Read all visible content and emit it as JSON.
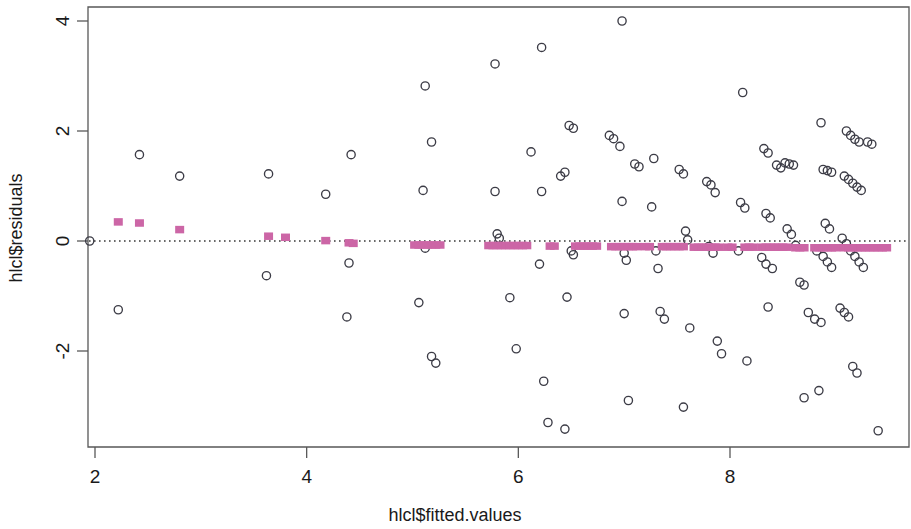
{
  "chart_data": {
    "type": "scatter",
    "title": "",
    "xlabel": "hlcl$fitted.values",
    "ylabel": "hlcl$residuals",
    "xlim": [
      1.73,
      9.58
    ],
    "ylim": [
      -3.62,
      4.35
    ],
    "xticks": [
      2,
      4,
      6,
      8
    ],
    "xtick_labels": [
      "2",
      "4",
      "6",
      "8"
    ],
    "yticks": [
      -2,
      0,
      2,
      4
    ],
    "ytick_labels": [
      "-2",
      "0",
      "2",
      "4"
    ],
    "grid": false,
    "legend": null,
    "reference_line": {
      "type": "horizontal",
      "y": 0,
      "style": "dotted",
      "color": "#3a3a3a"
    },
    "series": [
      {
        "name": "residuals",
        "marker": "open-circle",
        "color": "#3c3c46",
        "fill": "none",
        "points": [
          [
            2.42,
            1.57
          ],
          [
            2.22,
            -1.25
          ],
          [
            2.8,
            1.18
          ],
          [
            3.64,
            1.22
          ],
          [
            3.62,
            -0.63
          ],
          [
            4.18,
            0.85
          ],
          [
            4.42,
            1.57
          ],
          [
            4.4,
            -0.4
          ],
          [
            4.38,
            -1.38
          ],
          [
            5.12,
            2.82
          ],
          [
            5.18,
            1.8
          ],
          [
            5.1,
            0.92
          ],
          [
            5.12,
            -0.13
          ],
          [
            5.06,
            -1.12
          ],
          [
            5.18,
            -2.1
          ],
          [
            5.22,
            -2.22
          ],
          [
            5.78,
            3.22
          ],
          [
            5.8,
            0.13
          ],
          [
            5.82,
            0.05
          ],
          [
            5.78,
            0.9
          ],
          [
            5.92,
            -1.03
          ],
          [
            5.98,
            -1.96
          ],
          [
            6.22,
            3.52
          ],
          [
            6.12,
            1.62
          ],
          [
            6.22,
            0.9
          ],
          [
            6.2,
            -0.42
          ],
          [
            6.24,
            -2.55
          ],
          [
            6.28,
            -3.3
          ],
          [
            6.44,
            -3.42
          ],
          [
            6.48,
            2.1
          ],
          [
            6.52,
            2.05
          ],
          [
            6.44,
            1.25
          ],
          [
            6.4,
            1.18
          ],
          [
            6.5,
            -0.18
          ],
          [
            6.52,
            -0.25
          ],
          [
            6.46,
            -1.02
          ],
          [
            6.98,
            4.0
          ],
          [
            6.96,
            1.72
          ],
          [
            6.98,
            0.72
          ],
          [
            7.0,
            -0.22
          ],
          [
            7.02,
            -0.35
          ],
          [
            7.0,
            -1.32
          ],
          [
            7.04,
            -2.9
          ],
          [
            7.28,
            1.5
          ],
          [
            7.26,
            0.62
          ],
          [
            7.3,
            -0.18
          ],
          [
            7.32,
            -0.5
          ],
          [
            7.34,
            -1.28
          ],
          [
            7.38,
            -1.42
          ],
          [
            7.52,
            1.3
          ],
          [
            7.56,
            1.22
          ],
          [
            7.58,
            0.18
          ],
          [
            7.6,
            0.02
          ],
          [
            7.62,
            -1.58
          ],
          [
            7.56,
            -3.02
          ],
          [
            7.78,
            1.08
          ],
          [
            7.82,
            1.02
          ],
          [
            7.86,
            0.88
          ],
          [
            7.8,
            -0.1
          ],
          [
            7.84,
            -0.22
          ],
          [
            7.88,
            -1.82
          ],
          [
            7.92,
            -2.05
          ],
          [
            8.12,
            2.7
          ],
          [
            8.1,
            0.7
          ],
          [
            8.14,
            0.6
          ],
          [
            8.08,
            -0.18
          ],
          [
            8.16,
            -2.18
          ],
          [
            8.32,
            1.68
          ],
          [
            8.36,
            1.6
          ],
          [
            8.34,
            0.5
          ],
          [
            8.38,
            0.42
          ],
          [
            8.3,
            -0.3
          ],
          [
            8.34,
            -0.42
          ],
          [
            8.4,
            -0.5
          ],
          [
            8.36,
            -1.2
          ],
          [
            8.52,
            1.42
          ],
          [
            8.56,
            1.4
          ],
          [
            8.6,
            1.38
          ],
          [
            8.54,
            0.22
          ],
          [
            8.58,
            0.12
          ],
          [
            8.62,
            -0.08
          ],
          [
            8.66,
            -0.75
          ],
          [
            8.7,
            -0.8
          ],
          [
            8.74,
            -1.3
          ],
          [
            8.7,
            -2.85
          ],
          [
            8.86,
            2.15
          ],
          [
            8.88,
            1.3
          ],
          [
            8.92,
            1.28
          ],
          [
            8.96,
            1.25
          ],
          [
            8.9,
            0.32
          ],
          [
            8.94,
            0.22
          ],
          [
            8.82,
            -0.18
          ],
          [
            8.88,
            -0.28
          ],
          [
            8.92,
            -0.38
          ],
          [
            8.96,
            -0.48
          ],
          [
            8.8,
            -1.42
          ],
          [
            8.86,
            -1.48
          ],
          [
            8.84,
            -2.72
          ],
          [
            9.1,
            2.0
          ],
          [
            9.14,
            1.92
          ],
          [
            9.18,
            1.85
          ],
          [
            9.22,
            1.8
          ],
          [
            9.08,
            1.18
          ],
          [
            9.12,
            1.12
          ],
          [
            9.16,
            1.05
          ],
          [
            9.2,
            0.98
          ],
          [
            9.24,
            0.92
          ],
          [
            9.06,
            0.05
          ],
          [
            9.1,
            -0.05
          ],
          [
            9.14,
            -0.18
          ],
          [
            9.18,
            -0.28
          ],
          [
            9.22,
            -0.38
          ],
          [
            9.26,
            -0.48
          ],
          [
            9.04,
            -1.22
          ],
          [
            9.08,
            -1.3
          ],
          [
            9.12,
            -1.38
          ],
          [
            9.16,
            -2.28
          ],
          [
            9.2,
            -2.4
          ],
          [
            9.4,
            -3.45
          ],
          [
            1.95,
            0.0
          ],
          [
            6.86,
            1.92
          ],
          [
            6.9,
            1.86
          ],
          [
            7.1,
            1.4
          ],
          [
            7.14,
            1.35
          ],
          [
            8.44,
            1.38
          ],
          [
            8.48,
            1.33
          ],
          [
            9.3,
            1.8
          ],
          [
            9.34,
            1.76
          ]
        ]
      },
      {
        "name": "smoother",
        "marker": "filled-square",
        "color": "#c2549a",
        "fill": "#cc66a6",
        "points": [
          [
            2.22,
            0.42
          ],
          [
            2.42,
            0.4
          ],
          [
            2.8,
            0.28
          ],
          [
            3.64,
            0.16
          ],
          [
            3.8,
            0.14
          ],
          [
            4.18,
            0.08
          ],
          [
            4.4,
            0.04
          ],
          [
            4.44,
            0.03
          ],
          [
            5.02,
            0.0
          ],
          [
            5.06,
            0.0
          ],
          [
            5.1,
            0.0
          ],
          [
            5.14,
            0.0
          ],
          [
            5.18,
            0.0
          ],
          [
            5.22,
            0.0
          ],
          [
            5.26,
            0.0
          ],
          [
            5.72,
            -0.01
          ],
          [
            5.76,
            -0.01
          ],
          [
            5.8,
            -0.01
          ],
          [
            5.84,
            -0.01
          ],
          [
            5.88,
            -0.01
          ],
          [
            5.92,
            -0.01
          ],
          [
            5.96,
            -0.01
          ],
          [
            6.0,
            -0.01
          ],
          [
            6.04,
            -0.01
          ],
          [
            6.08,
            -0.01
          ],
          [
            6.3,
            -0.02
          ],
          [
            6.34,
            -0.02
          ],
          [
            6.54,
            -0.02
          ],
          [
            6.58,
            -0.02
          ],
          [
            6.62,
            -0.02
          ],
          [
            6.66,
            -0.02
          ],
          [
            6.7,
            -0.02
          ],
          [
            6.74,
            -0.02
          ],
          [
            6.88,
            -0.03
          ],
          [
            6.92,
            -0.03
          ],
          [
            6.96,
            -0.03
          ],
          [
            7.0,
            -0.03
          ],
          [
            7.04,
            -0.03
          ],
          [
            7.08,
            -0.03
          ],
          [
            7.12,
            -0.03
          ],
          [
            7.2,
            -0.03
          ],
          [
            7.24,
            -0.03
          ],
          [
            7.36,
            -0.03
          ],
          [
            7.4,
            -0.03
          ],
          [
            7.44,
            -0.03
          ],
          [
            7.48,
            -0.03
          ],
          [
            7.52,
            -0.03
          ],
          [
            7.56,
            -0.03
          ],
          [
            7.66,
            -0.04
          ],
          [
            7.7,
            -0.04
          ],
          [
            7.74,
            -0.04
          ],
          [
            7.78,
            -0.04
          ],
          [
            7.82,
            -0.04
          ],
          [
            7.86,
            -0.04
          ],
          [
            7.9,
            -0.04
          ],
          [
            7.98,
            -0.04
          ],
          [
            8.02,
            -0.04
          ],
          [
            8.14,
            -0.04
          ],
          [
            8.18,
            -0.04
          ],
          [
            8.22,
            -0.04
          ],
          [
            8.3,
            -0.04
          ],
          [
            8.34,
            -0.04
          ],
          [
            8.38,
            -0.04
          ],
          [
            8.42,
            -0.04
          ],
          [
            8.46,
            -0.04
          ],
          [
            8.5,
            -0.04
          ],
          [
            8.54,
            -0.04
          ],
          [
            8.62,
            -0.05
          ],
          [
            8.66,
            -0.05
          ],
          [
            8.7,
            -0.05
          ],
          [
            8.8,
            -0.05
          ],
          [
            8.84,
            -0.05
          ],
          [
            8.88,
            -0.05
          ],
          [
            8.92,
            -0.05
          ],
          [
            8.96,
            -0.05
          ],
          [
            9.0,
            -0.05
          ],
          [
            9.08,
            -0.05
          ],
          [
            9.12,
            -0.05
          ],
          [
            9.16,
            -0.05
          ],
          [
            9.2,
            -0.05
          ],
          [
            9.24,
            -0.05
          ],
          [
            9.28,
            -0.05
          ],
          [
            9.32,
            -0.05
          ],
          [
            9.36,
            -0.05
          ],
          [
            9.4,
            -0.05
          ],
          [
            9.44,
            -0.05
          ],
          [
            9.48,
            -0.05
          ]
        ]
      }
    ]
  },
  "axes": {
    "x_title": "hlcl$fitted.values",
    "y_title": "hlcl$residuals",
    "x_tick_labels": [
      "2",
      "4",
      "6",
      "8"
    ],
    "y_tick_labels": [
      "4",
      "2",
      "0",
      "-2"
    ]
  },
  "colors": {
    "point_stroke": "#3c3c46",
    "smoother": "#cc66a6",
    "frame": "#585858",
    "zero_line": "#3a3a3a",
    "background": "#ffffff"
  }
}
